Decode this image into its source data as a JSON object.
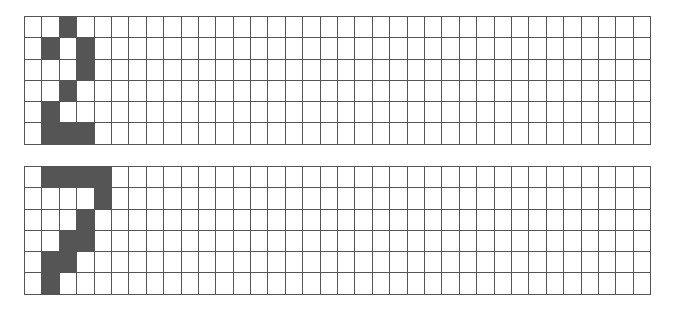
{
  "grids": [
    {
      "name": "top-grid",
      "rows": 6,
      "cols": 36,
      "fill_color": "#555555",
      "filled": [
        [
          0,
          2
        ],
        [
          1,
          1
        ],
        [
          1,
          3
        ],
        [
          2,
          3
        ],
        [
          3,
          2
        ],
        [
          4,
          1
        ],
        [
          5,
          1
        ],
        [
          5,
          2
        ],
        [
          5,
          3
        ]
      ]
    },
    {
      "name": "bottom-grid",
      "rows": 6,
      "cols": 36,
      "fill_color": "#555555",
      "filled": [
        [
          0,
          1
        ],
        [
          0,
          2
        ],
        [
          0,
          3
        ],
        [
          0,
          4
        ],
        [
          1,
          4
        ],
        [
          2,
          3
        ],
        [
          3,
          2
        ],
        [
          3,
          3
        ],
        [
          4,
          1
        ],
        [
          4,
          2
        ],
        [
          5,
          1
        ]
      ]
    }
  ]
}
